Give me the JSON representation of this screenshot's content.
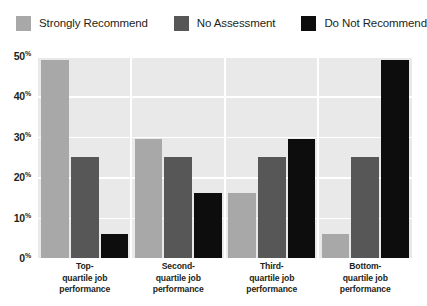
{
  "chart_data": {
    "type": "bar",
    "title": "",
    "subtitle": "",
    "xlabel": "",
    "ylabel": "",
    "grid": true,
    "legend_position": "top-left",
    "ylim": [
      0,
      50
    ],
    "yticks": [
      50,
      40,
      30,
      20,
      10,
      0
    ],
    "ytick_labels": [
      "50",
      "40",
      "30",
      "20",
      "10",
      "0"
    ],
    "ytick_suffix": "%",
    "categories": [
      "Top-\nquartile job\nperformance",
      "Second-\nquartile job\nperformance",
      "Third-\nquartile job\nperformance",
      "Bottom-\nquartile job\nperformance"
    ],
    "category_lines": [
      [
        "Top-",
        "quartile job",
        "performance"
      ],
      [
        "Second-",
        "quartile job",
        "performance"
      ],
      [
        "Third-",
        "quartile job",
        "performance"
      ],
      [
        "Bottom-",
        "quartile job",
        "performance"
      ]
    ],
    "series": [
      {
        "name": "Strongly Recommend",
        "color": "#a8a8a8",
        "values": [
          49,
          29.5,
          16,
          6
        ]
      },
      {
        "name": "No Assessment",
        "color": "#575757",
        "values": [
          25,
          25,
          25,
          25
        ]
      },
      {
        "name": "Do Not Recommend",
        "color": "#0d0d0d",
        "values": [
          6,
          16,
          29.5,
          49
        ]
      }
    ]
  },
  "legend": {
    "items": [
      {
        "label": "Strongly Recommend",
        "color": "#a8a8a8"
      },
      {
        "label": "No Assessment",
        "color": "#575757"
      },
      {
        "label": "Do Not Recommend",
        "color": "#0d0d0d"
      }
    ]
  },
  "colors": {
    "plot_background": "#e9e9e9",
    "gridline": "#ffffff",
    "text": "#231f20",
    "page_background": "#ffffff"
  }
}
